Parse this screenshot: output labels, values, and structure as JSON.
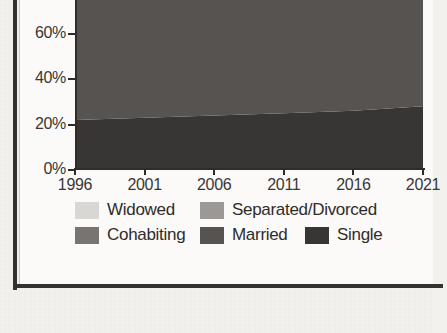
{
  "chart_data": {
    "type": "area",
    "stacked": true,
    "title": "",
    "xlabel": "",
    "ylabel": "",
    "grid": false,
    "legend_position": "bottom",
    "x": [
      1996,
      2001,
      2006,
      2011,
      2016,
      2021
    ],
    "xtick_labels": [
      "1996",
      "2001",
      "2006",
      "2011",
      "2016",
      "2021"
    ],
    "ytick_labels": [
      "80%",
      "60%",
      "40%",
      "20%",
      "0%"
    ],
    "ytick_values": [
      80,
      60,
      40,
      20,
      0
    ],
    "ylim": [
      0,
      100
    ],
    "xlim": [
      1996,
      2021
    ],
    "note": "Top of chart is cropped; the 80% label and the Widowed / Separated-Divorced bands are only partly visible.",
    "series": [
      {
        "name": "Single",
        "color": "#383634",
        "values": [
          22,
          23,
          24,
          25,
          26,
          28
        ]
      },
      {
        "name": "Married",
        "color": "#565350",
        "values": [
          56,
          54,
          52,
          51,
          49,
          47
        ]
      },
      {
        "name": "Cohabiting",
        "color": "#777471",
        "values": [
          8,
          9,
          10,
          11,
          12,
          13
        ]
      },
      {
        "name": "Separated/Divorced",
        "color": "#9b9895",
        "values": [
          8,
          8,
          8,
          8,
          8,
          7
        ]
      },
      {
        "name": "Widowed",
        "color": "#d9d7d3",
        "values": [
          6,
          6,
          6,
          5,
          5,
          5
        ]
      }
    ]
  },
  "axes": {
    "y_ticks": [
      {
        "label": "80%",
        "value": 80
      },
      {
        "label": "60%",
        "value": 60
      },
      {
        "label": "40%",
        "value": 40
      },
      {
        "label": "20%",
        "value": 20
      },
      {
        "label": "0%",
        "value": 0
      }
    ],
    "x_ticks": [
      {
        "label": "1996"
      },
      {
        "label": "2001"
      },
      {
        "label": "2006"
      },
      {
        "label": "2011"
      },
      {
        "label": "2016"
      },
      {
        "label": "2021"
      }
    ]
  },
  "legend": {
    "rows": [
      [
        {
          "label": "Widowed",
          "color": "#d9d7d3"
        },
        {
          "label": "Separated/Divorced",
          "color": "#9b9895"
        }
      ],
      [
        {
          "label": "Cohabiting",
          "color": "#777471"
        },
        {
          "label": "Married",
          "color": "#565350"
        },
        {
          "label": "Single",
          "color": "#383634"
        }
      ]
    ]
  },
  "colors": {
    "frame": "#35312e",
    "page": "#f3f2ef",
    "figure": "#fbfaf8",
    "axis": "#2e2b29",
    "text": "#3a3734"
  }
}
